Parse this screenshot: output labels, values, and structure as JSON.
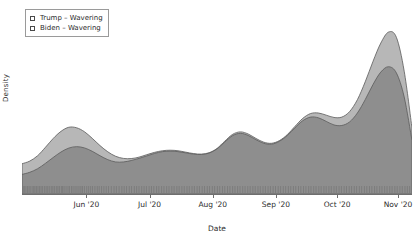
{
  "chart_data": {
    "type": "area",
    "title": "",
    "subtitle": "",
    "xlabel": "Date",
    "ylabel": "Density",
    "grid": false,
    "legend_position": "top-left",
    "x_tick_labels": [
      "Jun '20",
      "Jul '20",
      "Aug '20",
      "Sep '20",
      "Oct '20",
      "Nov '20"
    ],
    "x_tick_positions_frac": [
      0.165,
      0.327,
      0.489,
      0.651,
      0.808,
      0.964
    ],
    "y_tick_labels": [],
    "ylim": [
      0,
      1
    ],
    "xlim": [
      "2020-05-10",
      "2020-11-12"
    ],
    "colors": {
      "trump_fill": "#b7b7b7",
      "biden_fill": "#8e8e8e",
      "outline": "#5a5a5a",
      "axis": "#6e6e6e",
      "text": "#2b2b2b",
      "background": "#ffffff"
    },
    "series": [
      {
        "name": "Trump – Wavering",
        "fill": "#b7b7b7",
        "x_frac": [
          0.0,
          0.02,
          0.04,
          0.06,
          0.08,
          0.1,
          0.12,
          0.14,
          0.16,
          0.18,
          0.2,
          0.22,
          0.24,
          0.26,
          0.28,
          0.3,
          0.32,
          0.34,
          0.36,
          0.38,
          0.4,
          0.42,
          0.44,
          0.46,
          0.48,
          0.5,
          0.52,
          0.54,
          0.56,
          0.58,
          0.6,
          0.62,
          0.64,
          0.66,
          0.68,
          0.7,
          0.72,
          0.74,
          0.76,
          0.78,
          0.8,
          0.82,
          0.84,
          0.86,
          0.88,
          0.9,
          0.92,
          0.94,
          0.96,
          0.98,
          1.0
        ],
        "values": [
          0.17,
          0.185,
          0.215,
          0.262,
          0.312,
          0.352,
          0.375,
          0.372,
          0.35,
          0.313,
          0.272,
          0.237,
          0.212,
          0.2,
          0.199,
          0.207,
          0.221,
          0.234,
          0.243,
          0.246,
          0.243,
          0.235,
          0.227,
          0.224,
          0.232,
          0.256,
          0.297,
          0.335,
          0.349,
          0.337,
          0.312,
          0.291,
          0.285,
          0.3,
          0.333,
          0.38,
          0.425,
          0.452,
          0.455,
          0.443,
          0.43,
          0.432,
          0.463,
          0.53,
          0.63,
          0.745,
          0.848,
          0.91,
          0.88,
          0.69,
          0.37
        ]
      },
      {
        "name": "Biden – Wavering",
        "fill": "#8e8e8e",
        "x_frac": [
          0.0,
          0.02,
          0.04,
          0.06,
          0.08,
          0.1,
          0.12,
          0.14,
          0.16,
          0.18,
          0.2,
          0.22,
          0.24,
          0.26,
          0.28,
          0.3,
          0.32,
          0.34,
          0.36,
          0.38,
          0.4,
          0.42,
          0.44,
          0.46,
          0.48,
          0.5,
          0.52,
          0.54,
          0.56,
          0.58,
          0.6,
          0.62,
          0.64,
          0.66,
          0.68,
          0.7,
          0.72,
          0.74,
          0.76,
          0.78,
          0.8,
          0.82,
          0.84,
          0.86,
          0.88,
          0.9,
          0.92,
          0.94,
          0.96,
          0.98,
          1.0
        ],
        "values": [
          0.11,
          0.122,
          0.142,
          0.172,
          0.205,
          0.236,
          0.258,
          0.266,
          0.259,
          0.24,
          0.215,
          0.193,
          0.18,
          0.18,
          0.188,
          0.2,
          0.214,
          0.228,
          0.238,
          0.241,
          0.238,
          0.231,
          0.224,
          0.222,
          0.23,
          0.253,
          0.292,
          0.328,
          0.341,
          0.329,
          0.305,
          0.285,
          0.28,
          0.296,
          0.328,
          0.372,
          0.412,
          0.432,
          0.428,
          0.408,
          0.388,
          0.385,
          0.405,
          0.455,
          0.53,
          0.615,
          0.685,
          0.715,
          0.68,
          0.545,
          0.3
        ]
      }
    ],
    "rug": {
      "present": true,
      "color": "#7a7a7a",
      "marks_frac": [
        0.003,
        0.006,
        0.01,
        0.014,
        0.018,
        0.021,
        0.026,
        0.03,
        0.033,
        0.037,
        0.041,
        0.045,
        0.049,
        0.053,
        0.058,
        0.062,
        0.066,
        0.07,
        0.075,
        0.079,
        0.083,
        0.088,
        0.092,
        0.096,
        0.101,
        0.104,
        0.108,
        0.113,
        0.118,
        0.122,
        0.127,
        0.131,
        0.136,
        0.141,
        0.146,
        0.151,
        0.155,
        0.16,
        0.166,
        0.171,
        0.176,
        0.181,
        0.187,
        0.193,
        0.198,
        0.204,
        0.21,
        0.216,
        0.222,
        0.229,
        0.236,
        0.242,
        0.249,
        0.256,
        0.262,
        0.268,
        0.275,
        0.281,
        0.288,
        0.294,
        0.3,
        0.307,
        0.313,
        0.319,
        0.326,
        0.332,
        0.338,
        0.345,
        0.351,
        0.358,
        0.364,
        0.371,
        0.377,
        0.384,
        0.39,
        0.397,
        0.403,
        0.41,
        0.416,
        0.423,
        0.429,
        0.436,
        0.442,
        0.449,
        0.455,
        0.462,
        0.468,
        0.475,
        0.481,
        0.488,
        0.494,
        0.501,
        0.507,
        0.514,
        0.52,
        0.527,
        0.533,
        0.54,
        0.546,
        0.553,
        0.559,
        0.566,
        0.572,
        0.579,
        0.585,
        0.592,
        0.598,
        0.605,
        0.611,
        0.618,
        0.624,
        0.631,
        0.637,
        0.644,
        0.65,
        0.657,
        0.663,
        0.67,
        0.676,
        0.683,
        0.689,
        0.696,
        0.702,
        0.709,
        0.715,
        0.722,
        0.728,
        0.735,
        0.741,
        0.748,
        0.754,
        0.761,
        0.767,
        0.774,
        0.78,
        0.787,
        0.793,
        0.8,
        0.806,
        0.813,
        0.819,
        0.826,
        0.832,
        0.839,
        0.845,
        0.852,
        0.858,
        0.865,
        0.871,
        0.878,
        0.884,
        0.891,
        0.897,
        0.904,
        0.91,
        0.917,
        0.923,
        0.93,
        0.936,
        0.943,
        0.949,
        0.956,
        0.962,
        0.969,
        0.975,
        0.982,
        0.988,
        0.994,
        0.999
      ]
    }
  },
  "legend": {
    "items": [
      {
        "label": "Trump – Wavering",
        "swatch_color": "#b7b7b7"
      },
      {
        "label": "Biden – Wavering",
        "swatch_color": "#8e8e8e"
      }
    ]
  },
  "axes": {
    "x_title": "Date",
    "y_title": "Density"
  }
}
